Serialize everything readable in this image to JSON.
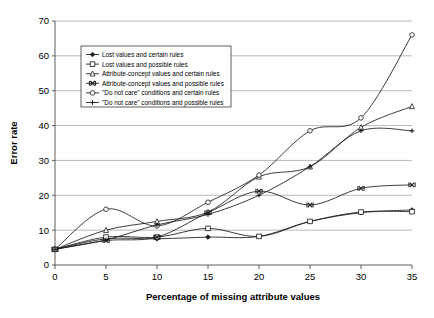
{
  "chart_data": {
    "type": "line",
    "title": "",
    "xlabel": "Percentage of missing attribute values",
    "ylabel": "Error rate",
    "x": [
      0,
      5,
      10,
      15,
      20,
      25,
      30,
      35
    ],
    "xlim": [
      0,
      35
    ],
    "ylim": [
      0,
      70
    ],
    "xticks": [
      "0",
      "5",
      "10",
      "15",
      "20",
      "25",
      "30",
      "35"
    ],
    "yticks": [
      "0",
      "10",
      "20",
      "30",
      "40",
      "50",
      "60",
      "70"
    ],
    "grid": "horizontal",
    "legend_position": "upper-left-inside",
    "series": [
      {
        "name": "Lost values and certain rules",
        "marker": "diamond",
        "values": [
          4.5,
          7.5,
          7.5,
          8.0,
          8.2,
          12.5,
          15.0,
          15.8
        ]
      },
      {
        "name": "Lost values and possible rules",
        "marker": "square",
        "values": [
          4.5,
          8.0,
          8.0,
          10.5,
          8.2,
          12.5,
          15.2,
          15.3
        ]
      },
      {
        "name": "Attribute-concept values and certain rules",
        "marker": "triangle",
        "values": [
          4.5,
          10.0,
          12.5,
          15.2,
          25.3,
          28.2,
          39.5,
          45.5
        ]
      },
      {
        "name": "Attribute-concept values and possible rules",
        "marker": "cross",
        "values": [
          4.5,
          7.0,
          8.0,
          15.0,
          21.2,
          17.2,
          22.0,
          23.0
        ]
      },
      {
        "name": "\"Do not care\" conditions and certain rules",
        "marker": "circle",
        "values": [
          4.5,
          16.0,
          11.2,
          18.0,
          25.8,
          38.5,
          42.2,
          66.0
        ]
      },
      {
        "name": "\"Do not care\" conditions and possible rules",
        "marker": "plus",
        "values": [
          4.5,
          7.2,
          11.5,
          14.5,
          20.0,
          28.2,
          38.5,
          38.5
        ]
      }
    ],
    "colors": {
      "line": "#1a1a1a",
      "grid": "#999999",
      "axis": "#4d4d4d",
      "background": "#ffffff"
    }
  }
}
